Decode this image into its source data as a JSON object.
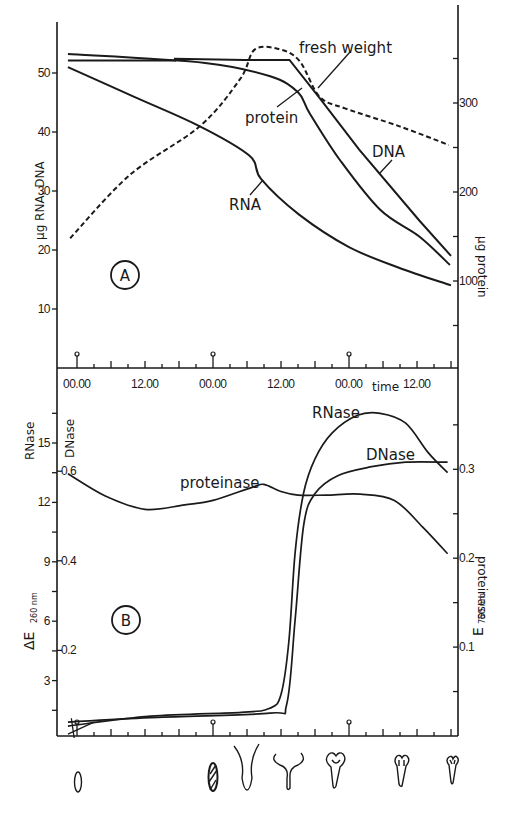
{
  "chart_data": [
    {
      "panel": "A",
      "type": "line",
      "title": "",
      "xlabel": "time",
      "x_tick_labels": [
        "00.00",
        "12.00",
        "00.00",
        "12.00",
        "00.00",
        "12.00"
      ],
      "x_tick_hours": [
        0,
        12,
        24,
        36,
        48,
        60
      ],
      "x_range_hours": [
        -2,
        66
      ],
      "ylabel_left": "µg RNA, DNA",
      "ylim_left": [
        0,
        58
      ],
      "y_ticks_left": [
        10,
        20,
        30,
        40,
        50
      ],
      "ylabel_right": "µg protein",
      "ylim_right": [
        0,
        400
      ],
      "y_ticks_right": [
        100,
        200,
        300
      ],
      "grid": false,
      "series": [
        {
          "name": "RNA",
          "axis": "left",
          "style": "solid",
          "x": [
            -1.6,
            10,
            21.6,
            30.4,
            32.5,
            39.2,
            48,
            56.8,
            66
          ],
          "values": [
            51,
            46,
            41,
            36,
            32,
            26,
            20.5,
            17,
            14
          ]
        },
        {
          "name": "DNA",
          "axis": "left",
          "style": "solid",
          "x": [
            -1.6,
            17.3,
            17.3,
            29.6,
            37.5,
            42.8,
            49.8,
            60.4,
            66
          ],
          "values": [
            52.1,
            52.1,
            52.4,
            52.2,
            52.2,
            45.8,
            37,
            25,
            19
          ]
        },
        {
          "name": "protein",
          "axis": "right",
          "style": "solid",
          "x": [
            -1.6,
            22.6,
            34.1,
            39,
            41.1,
            46.4,
            53.5,
            60.4,
            65.8
          ],
          "values": [
            355,
            345,
            330,
            312,
            288,
            236,
            180,
            150,
            118
          ]
        },
        {
          "name": "fresh weight",
          "axis": "left",
          "style": "dashed",
          "x": [
            -1.2,
            9.3,
            21.7,
            28.8,
            31.4,
            35.8,
            39.3,
            42.8,
            47.3,
            56.8,
            65.6
          ],
          "values": [
            22,
            32.7,
            41,
            49,
            54,
            54,
            52,
            46,
            44,
            41,
            37.8
          ]
        }
      ],
      "annotations": [
        "fresh weight",
        "protein",
        "DNA",
        "RNA",
        "A"
      ]
    },
    {
      "panel": "B",
      "type": "line",
      "title": "",
      "xlabel": "",
      "x_range_hours": [
        -2,
        66
      ],
      "ylabel_left": "ΔE 260 nm",
      "ylim_left": [
        0,
        18
      ],
      "y_ticks_left": [
        3,
        6,
        9,
        12,
        15
      ],
      "ylabel_left_2": "RNase / DNase",
      "y_ticks_left_dnase": [
        0.2,
        0.4,
        0.6
      ],
      "ylabel_right": "E 750 nm proteinase",
      "ylim_right": [
        0,
        0.38
      ],
      "y_ticks_right": [
        0.1,
        0.2,
        0.3
      ],
      "grid": false,
      "series": [
        {
          "name": "RNase",
          "axis": "left",
          "unit": "ΔE260",
          "x": [
            -1.6,
            13,
            29,
            34,
            36,
            37.4,
            38.5,
            40,
            42,
            45,
            49.5,
            53.5,
            58,
            62,
            65.4
          ],
          "values": [
            0.7,
            1.2,
            1.4,
            1.6,
            2.3,
            5,
            9.5,
            12.5,
            14.2,
            15.5,
            16.4,
            16.5,
            16,
            14.5,
            13.5
          ]
        },
        {
          "name": "DNase",
          "axis": "left_dnase",
          "unit": "ΔE260",
          "x": [
            -1.6,
            13,
            34,
            37,
            38.5,
            40,
            42,
            46,
            52,
            58,
            65.4
          ],
          "values": [
            0.04,
            0.05,
            0.06,
            0.08,
            0.27,
            0.48,
            0.55,
            0.59,
            0.61,
            0.62,
            0.62
          ]
        },
        {
          "name": "proteinase",
          "axis": "right",
          "unit": "E750",
          "x": [
            -1.6,
            5,
            12,
            19,
            24,
            31,
            33,
            36,
            39,
            44,
            50,
            56,
            61,
            65.4
          ],
          "values": [
            0.295,
            0.27,
            0.255,
            0.26,
            0.265,
            0.28,
            0.283,
            0.275,
            0.271,
            0.271,
            0.272,
            0.265,
            0.235,
            0.205
          ]
        }
      ],
      "annotations": [
        "RNase",
        "DNase",
        "proteinase",
        "B"
      ]
    }
  ],
  "labels": {
    "panel_a": "A",
    "panel_b": "B",
    "time": "time",
    "fresh_weight": "fresh weight",
    "protein": "protein",
    "dna": "DNA",
    "rna": "RNA",
    "rnase": "RNase",
    "dnase": "DNase",
    "proteinase": "proteinase",
    "y_left_a": "µg RNA, DNA",
    "y_right_a": "µg protein",
    "y_left_b_rnase": "RNase",
    "y_left_b_dnase": "DNase",
    "y_left_b_unit": "ΔE",
    "y_left_b_sub": "260 nm",
    "y_right_b": "proteinase",
    "y_right_b_unit": "E",
    "y_right_b_sub": "750 nm"
  },
  "stage_icons": [
    "embryo-oval",
    "hatched-oval",
    "v-shape",
    "cup-shape",
    "trilobed-large",
    "trilobed-medium",
    "trilobed-small"
  ]
}
